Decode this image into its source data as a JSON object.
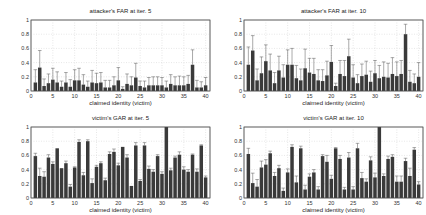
{
  "figure": {
    "background": "#ffffff",
    "bar_color": "#3a3a3a",
    "error_color": "#555555",
    "grid_color": "#cfcfcf"
  },
  "chart_data": [
    {
      "type": "bar",
      "title": "attacker's FAR at iter. 5",
      "xlabel": "claimed identity (victim)",
      "ylabel": "",
      "xlim": [
        0,
        41
      ],
      "ylim": [
        0,
        1
      ],
      "xticks": [
        0,
        5,
        10,
        15,
        20,
        25,
        30,
        35,
        40
      ],
      "yticks": [
        "0",
        "0.2",
        "0.4",
        "0.6",
        "0.8",
        "1"
      ],
      "grid": true,
      "categories": [
        1,
        2,
        3,
        4,
        5,
        6,
        7,
        8,
        9,
        10,
        11,
        12,
        13,
        14,
        15,
        16,
        17,
        18,
        19,
        20,
        21,
        22,
        23,
        24,
        25,
        26,
        27,
        28,
        29,
        30,
        31,
        32,
        33,
        34,
        35,
        36,
        37,
        38,
        39,
        40
      ],
      "values": [
        0.12,
        0.33,
        0.07,
        0.11,
        0.16,
        0.12,
        0.06,
        0.12,
        0.06,
        0.15,
        0.15,
        0.09,
        0.06,
        0.12,
        0.11,
        0.12,
        0.05,
        0.05,
        0.08,
        0.15,
        0.03,
        0.1,
        0.08,
        0.19,
        0.07,
        0.05,
        0.08,
        0.08,
        0.08,
        0.08,
        0.05,
        0.1,
        0.08,
        0.08,
        0.08,
        0.1,
        0.37,
        0.05,
        0.05,
        0.08
      ],
      "errors": [
        0.18,
        0.24,
        0.1,
        0.13,
        0.16,
        0.15,
        0.08,
        0.14,
        0.1,
        0.15,
        0.17,
        0.14,
        0.08,
        0.17,
        0.14,
        0.14,
        0.1,
        0.1,
        0.12,
        0.18,
        0.03,
        0.14,
        0.12,
        0.2,
        0.07,
        0.09,
        0.11,
        0.12,
        0.12,
        0.11,
        0.09,
        0.13,
        0.12,
        0.13,
        0.12,
        0.12,
        0.21,
        0.1,
        0.08,
        0.11
      ]
    },
    {
      "type": "bar",
      "title": "attacker's FAR at iter. 10",
      "xlabel": "claimed identity (victim)",
      "ylabel": "",
      "xlim": [
        0,
        41
      ],
      "ylim": [
        0,
        1
      ],
      "xticks": [
        0,
        5,
        10,
        15,
        20,
        25,
        30,
        35,
        40
      ],
      "yticks": [
        "0",
        "0.2",
        "0.4",
        "0.6",
        "0.8",
        "1"
      ],
      "grid": true,
      "categories": [
        1,
        2,
        3,
        4,
        5,
        6,
        7,
        8,
        9,
        10,
        11,
        12,
        13,
        14,
        15,
        16,
        17,
        18,
        19,
        20,
        21,
        22,
        23,
        24,
        25,
        26,
        27,
        28,
        29,
        30,
        31,
        32,
        33,
        34,
        35,
        36,
        37,
        38,
        39,
        40
      ],
      "values": [
        0.37,
        0.57,
        0.15,
        0.25,
        0.42,
        0.29,
        0.11,
        0.29,
        0.19,
        0.37,
        0.37,
        0.18,
        0.15,
        0.32,
        0.26,
        0.24,
        0.15,
        0.14,
        0.22,
        0.41,
        0.07,
        0.24,
        0.21,
        0.49,
        0.19,
        0.11,
        0.21,
        0.23,
        0.13,
        0.25,
        0.18,
        0.2,
        0.19,
        0.24,
        0.21,
        0.24,
        0.8,
        0.13,
        0.11,
        0.2
      ],
      "errors": [
        0.25,
        0.21,
        0.16,
        0.23,
        0.23,
        0.23,
        0.15,
        0.2,
        0.18,
        0.21,
        0.23,
        0.18,
        0.16,
        0.27,
        0.2,
        0.22,
        0.15,
        0.16,
        0.2,
        0.23,
        0.04,
        0.19,
        0.22,
        0.24,
        0.18,
        0.12,
        0.17,
        0.19,
        0.15,
        0.18,
        0.18,
        0.21,
        0.2,
        0.23,
        0.2,
        0.19,
        0.14,
        0.16,
        0.13,
        0.2
      ]
    },
    {
      "type": "bar",
      "title": "victim's GAR at iter. 5",
      "xlabel": "claimed identity (victim)",
      "ylabel": "",
      "xlim": [
        0,
        41
      ],
      "ylim": [
        0,
        1
      ],
      "xticks": [
        0,
        5,
        10,
        15,
        20,
        25,
        30,
        35,
        40
      ],
      "yticks": [
        "0",
        "0.2",
        "0.4",
        "0.6",
        "0.8",
        "1"
      ],
      "grid": true,
      "categories": [
        1,
        2,
        3,
        4,
        5,
        6,
        7,
        8,
        9,
        10,
        11,
        12,
        13,
        14,
        15,
        16,
        17,
        18,
        19,
        20,
        21,
        22,
        23,
        24,
        25,
        26,
        27,
        28,
        29,
        30,
        31,
        32,
        33,
        34,
        35,
        36,
        37,
        38,
        39,
        40
      ],
      "values": [
        0.59,
        0.31,
        0.3,
        0.57,
        0.48,
        0.7,
        0.42,
        0.49,
        0.16,
        0.43,
        0.79,
        0.32,
        0.8,
        0.21,
        0.44,
        0.49,
        0.25,
        0.62,
        0.65,
        0.46,
        0.72,
        0.57,
        0.17,
        0.74,
        0.24,
        0.74,
        0.41,
        0.37,
        0.59,
        0.34,
        1.0,
        0.39,
        0.57,
        0.61,
        0.4,
        0.37,
        0.61,
        0.37,
        0.74,
        0.29
      ],
      "errors": [
        0.04,
        0.11,
        0.07,
        0.04,
        0.03,
        0.0,
        0.0,
        0.03,
        0.03,
        0.01,
        0.03,
        0.04,
        0.02,
        0.06,
        0.02,
        0.02,
        0.03,
        0.03,
        0.04,
        0.03,
        0.0,
        0.04,
        0.0,
        0.04,
        0.02,
        0.04,
        0.04,
        0.03,
        0.02,
        0.03,
        0.0,
        0.03,
        0.02,
        0.04,
        0.04,
        0.03,
        0.01,
        0.04,
        0.01,
        0.02
      ]
    },
    {
      "type": "bar",
      "title": "victim's GAR at iter. 10",
      "xlabel": "claimed identity (victim)",
      "ylabel": "",
      "xlim": [
        0,
        41
      ],
      "ylim": [
        0,
        1
      ],
      "xticks": [
        0,
        5,
        10,
        15,
        20,
        25,
        30,
        35,
        40
      ],
      "yticks": [
        "0",
        "0.2",
        "0.4",
        "0.6",
        "0.8",
        "1"
      ],
      "grid": true,
      "categories": [
        1,
        2,
        3,
        4,
        5,
        6,
        7,
        8,
        9,
        10,
        11,
        12,
        13,
        14,
        15,
        16,
        17,
        18,
        19,
        20,
        21,
        22,
        23,
        24,
        25,
        26,
        27,
        28,
        29,
        30,
        31,
        32,
        33,
        34,
        35,
        36,
        37,
        38,
        39,
        40
      ],
      "values": [
        0.62,
        0.21,
        0.16,
        0.43,
        0.47,
        0.63,
        0.31,
        0.42,
        0.1,
        0.36,
        0.72,
        0.22,
        0.7,
        0.12,
        0.3,
        0.36,
        0.12,
        0.59,
        0.51,
        0.27,
        0.7,
        0.55,
        0.12,
        0.57,
        0.12,
        0.7,
        0.28,
        0.23,
        0.53,
        0.29,
        1.0,
        0.31,
        0.55,
        0.58,
        0.23,
        0.23,
        0.52,
        0.31,
        0.68,
        0.19
      ],
      "errors": [
        0.08,
        0.14,
        0.1,
        0.09,
        0.07,
        0.03,
        0.05,
        0.04,
        0.04,
        0.05,
        0.03,
        0.09,
        0.03,
        0.06,
        0.04,
        0.04,
        0.04,
        0.02,
        0.09,
        0.05,
        0.01,
        0.05,
        0.03,
        0.07,
        0.04,
        0.07,
        0.08,
        0.04,
        0.05,
        0.06,
        0.0,
        0.03,
        0.04,
        0.03,
        0.08,
        0.08,
        0.04,
        0.11,
        0.03,
        0.04
      ]
    }
  ]
}
